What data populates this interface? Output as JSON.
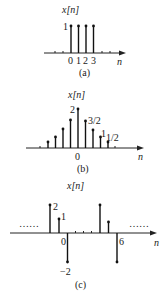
{
  "figures": [
    {
      "id": "a",
      "ylabel": "x[n]",
      "xlabel": "n",
      "caption": "(a)",
      "value_label": "1",
      "tick_labels": [
        "0",
        "1",
        "2",
        "3"
      ],
      "stems": [
        {
          "n": 0,
          "value": 1
        },
        {
          "n": 1,
          "value": 1
        },
        {
          "n": 2,
          "value": 1
        },
        {
          "n": 3,
          "value": 1
        }
      ]
    },
    {
      "id": "b",
      "ylabel": "x[n]",
      "xlabel": "n",
      "caption": "(b)",
      "origin_label": "0",
      "value_labels": [
        "2",
        "3/2",
        "1",
        "1/2"
      ],
      "stems": [
        {
          "n": -4,
          "value": 0.25
        },
        {
          "n": -3,
          "value": 0.5
        },
        {
          "n": -2,
          "value": 1
        },
        {
          "n": -1,
          "value": 1.5
        },
        {
          "n": 0,
          "value": 2
        },
        {
          "n": 1,
          "value": 1.5
        },
        {
          "n": 2,
          "value": 1
        },
        {
          "n": 3,
          "value": 0.5
        },
        {
          "n": 4,
          "value": 0.25
        }
      ]
    },
    {
      "id": "c",
      "ylabel": "x[n]",
      "xlabel": "n",
      "caption": "(c)",
      "labels": {
        "v2": "2",
        "v1": "1",
        "origin": "0",
        "vneg": "−2",
        "period": "6"
      },
      "ellipsis": "……",
      "period": 6,
      "stems": [
        {
          "n": -2,
          "value": 2
        },
        {
          "n": -1,
          "value": 1
        },
        {
          "n": 0,
          "value": -2
        },
        {
          "n": 4,
          "value": 2
        },
        {
          "n": 5,
          "value": 1
        },
        {
          "n": 6,
          "value": -2
        }
      ]
    }
  ]
}
